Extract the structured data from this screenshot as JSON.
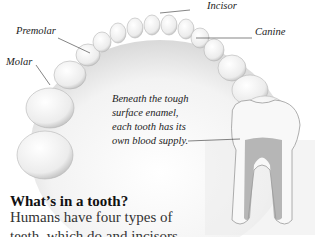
{
  "diagram": {
    "labels": {
      "incisor": "Incisor",
      "canine": "Canine",
      "premolar": "Premolar",
      "molar": "Molar"
    },
    "caption_lines": [
      "Beneath the tough",
      "surface enamel,",
      "each tooth has its",
      "own blood supply."
    ]
  },
  "article": {
    "heading": "What’s in a tooth?",
    "body_lines": [
      "Humans have four types of",
      "teeth, which do and incisors"
    ]
  },
  "colors": {
    "tooth": "#f4f4f4",
    "shadow": "#c9c9c9",
    "text": "#222222"
  }
}
